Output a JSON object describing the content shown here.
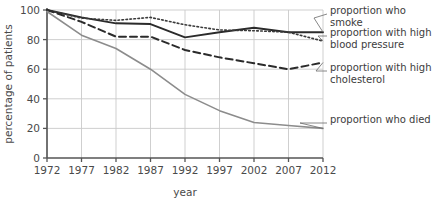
{
  "chart_data": {
    "type": "line",
    "title": "",
    "xlabel": "year",
    "ylabel": "percentage of patients",
    "x": [
      1972,
      1977,
      1982,
      1987,
      1992,
      1997,
      2002,
      2007,
      2012
    ],
    "xticklabels": [
      "1972",
      "1977",
      "1982",
      "1987",
      "1992",
      "1997",
      "2002",
      "2007",
      "2012"
    ],
    "yticklabels": [
      "0",
      "20",
      "40",
      "60",
      "80",
      "100"
    ],
    "yticks": [
      0,
      20,
      40,
      60,
      80,
      100
    ],
    "xlim": [
      1972,
      2012
    ],
    "ylim": [
      0,
      100
    ],
    "grid": true,
    "legend_position": "right-annotations",
    "series": [
      {
        "name": "proportion who smoke",
        "style": "solid",
        "color": "#2b2b2b",
        "width": 1.9,
        "values": [
          100,
          95,
          91,
          90.5,
          81.5,
          85,
          88,
          85,
          85
        ]
      },
      {
        "name": "proportion with high blood pressure",
        "style": "dotted",
        "color": "#3a3a3a",
        "width": 1.6,
        "values": [
          100,
          94.5,
          93,
          95,
          90,
          86.5,
          86,
          85,
          79
        ]
      },
      {
        "name": "proportion with high cholesterol",
        "style": "dashed",
        "color": "#2b2b2b",
        "width": 2.0,
        "values": [
          100,
          92,
          82,
          82,
          73,
          68,
          64,
          60,
          64.5
        ]
      },
      {
        "name": "proportion who died",
        "style": "solid",
        "color": "#8c8c8c",
        "width": 1.6,
        "values": [
          99,
          83,
          74,
          60,
          43,
          32,
          24,
          22,
          20
        ]
      }
    ]
  },
  "annotations": [
    {
      "id": "ann-smoke",
      "lines": [
        "proportion who smoke"
      ]
    },
    {
      "id": "ann-bp",
      "lines": [
        "proportion with high",
        "blood pressure"
      ]
    },
    {
      "id": "ann-chol",
      "lines": [
        "proportion with high",
        "cholesterol"
      ]
    },
    {
      "id": "ann-died",
      "lines": [
        "proportion who died"
      ]
    }
  ],
  "axis": {
    "ylabel": "percentage of patients",
    "xlabel": "year"
  },
  "colors": {
    "grid": "#c9c9c9",
    "axis": "#555555",
    "text": "#4a4a4a",
    "died_line": "#8c8c8c",
    "primary_line": "#2b2b2b"
  }
}
